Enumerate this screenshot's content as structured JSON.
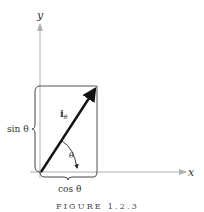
{
  "figure": {
    "caption": "FIGURE 1.2.3",
    "axes": {
      "x_label": "x",
      "y_label": "y"
    },
    "vector": {
      "label_main": "i",
      "label_sub": "θ"
    },
    "angle_label": "θ",
    "brace_vertical_label": "sin θ",
    "brace_horizontal_label": "cos θ",
    "colors": {
      "axis": "#b0b0b0",
      "vector": "#111111",
      "box": "#555555",
      "text": "#333333"
    }
  }
}
